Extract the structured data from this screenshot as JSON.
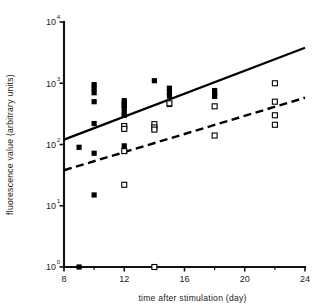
{
  "chart_data": {
    "type": "scatter",
    "title": "",
    "xlabel": "time after stimulation (day)",
    "ylabel": "fluorescence value (arbitrary units)",
    "xlim": [
      8,
      24
    ],
    "ylim": [
      1,
      10000
    ],
    "yscale": "log",
    "grid": false,
    "legend": "none",
    "xticks": [
      8,
      12,
      16,
      20,
      24
    ],
    "xtick_labels": [
      "8",
      "12",
      "16",
      "20",
      "24"
    ],
    "xminor_ticks": [
      10,
      14,
      18,
      22
    ],
    "yticks": [
      1,
      10,
      100,
      1000,
      10000
    ],
    "ytick_labels": [
      "10",
      "10",
      "10",
      "10",
      "10"
    ],
    "ytick_exponents": [
      "0",
      "1",
      "2",
      "3",
      "4"
    ],
    "series": [
      {
        "name": "filled squares",
        "marker": "filled-square",
        "color": "#000000",
        "points": [
          {
            "x": 9,
            "y": 1
          },
          {
            "x": 9,
            "y": 90
          },
          {
            "x": 10,
            "y": 950
          },
          {
            "x": 10,
            "y": 820
          },
          {
            "x": 10,
            "y": 700
          },
          {
            "x": 10,
            "y": 500
          },
          {
            "x": 10,
            "y": 220
          },
          {
            "x": 10,
            "y": 72
          },
          {
            "x": 10,
            "y": 15
          },
          {
            "x": 12,
            "y": 520
          },
          {
            "x": 12,
            "y": 470
          },
          {
            "x": 12,
            "y": 430
          },
          {
            "x": 12,
            "y": 390
          },
          {
            "x": 12,
            "y": 330
          },
          {
            "x": 12,
            "y": 300
          },
          {
            "x": 12,
            "y": 200
          },
          {
            "x": 12,
            "y": 180
          },
          {
            "x": 12,
            "y": 95
          },
          {
            "x": 14,
            "y": 1100
          },
          {
            "x": 15,
            "y": 830
          },
          {
            "x": 15,
            "y": 720
          },
          {
            "x": 15,
            "y": 620
          },
          {
            "x": 15,
            "y": 450
          },
          {
            "x": 18,
            "y": 760
          },
          {
            "x": 18,
            "y": 680
          },
          {
            "x": 18,
            "y": 610
          }
        ]
      },
      {
        "name": "open squares",
        "marker": "open-square",
        "color": "#000000",
        "points": [
          {
            "x": 12,
            "y": 200
          },
          {
            "x": 12,
            "y": 180
          },
          {
            "x": 12,
            "y": 78
          },
          {
            "x": 12,
            "y": 22
          },
          {
            "x": 14,
            "y": 1
          },
          {
            "x": 14,
            "y": 215
          },
          {
            "x": 14,
            "y": 190
          },
          {
            "x": 14,
            "y": 175
          },
          {
            "x": 15,
            "y": 470
          },
          {
            "x": 18,
            "y": 420
          },
          {
            "x": 18,
            "y": 140
          },
          {
            "x": 22,
            "y": 1000
          },
          {
            "x": 22,
            "y": 500
          },
          {
            "x": 22,
            "y": 300
          },
          {
            "x": 22,
            "y": 210
          }
        ]
      }
    ],
    "trend_lines": [
      {
        "name": "solid regression line",
        "style": "solid",
        "color": "#000000",
        "x_start": 8,
        "y_start": 120,
        "x_end": 24,
        "y_end": 3800
      },
      {
        "name": "dashed regression line",
        "style": "dashed",
        "color": "#000000",
        "x_start": 8,
        "y_start": 38,
        "x_end": 24,
        "y_end": 580
      }
    ]
  }
}
